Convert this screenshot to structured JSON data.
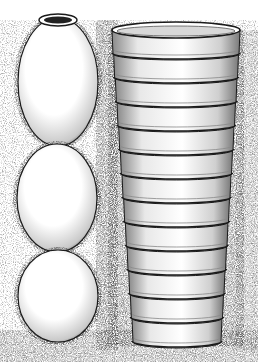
{
  "illustration": {
    "style": "stippled pen-and-ink",
    "background": "#ffffff",
    "ink": "#1a1a1a",
    "soil_tone": "#9a9a9a",
    "left_column": {
      "description": "three stacked egg-shaped clay pots",
      "pots": [
        {
          "cx": 58,
          "cy": 82,
          "rx": 40,
          "ry": 64,
          "mouth": true
        },
        {
          "cx": 57,
          "cy": 198,
          "rx": 40,
          "ry": 54,
          "mouth": false
        },
        {
          "cx": 58,
          "cy": 296,
          "rx": 40,
          "ry": 46,
          "mouth": false
        }
      ]
    },
    "right_column": {
      "description": "ribbed cylindrical stacked-ring well lining",
      "top": {
        "x1": 112,
        "x2": 240,
        "y": 30
      },
      "bottom": {
        "x1": 132,
        "x2": 222,
        "y": 342
      },
      "ring_count": 13
    }
  }
}
